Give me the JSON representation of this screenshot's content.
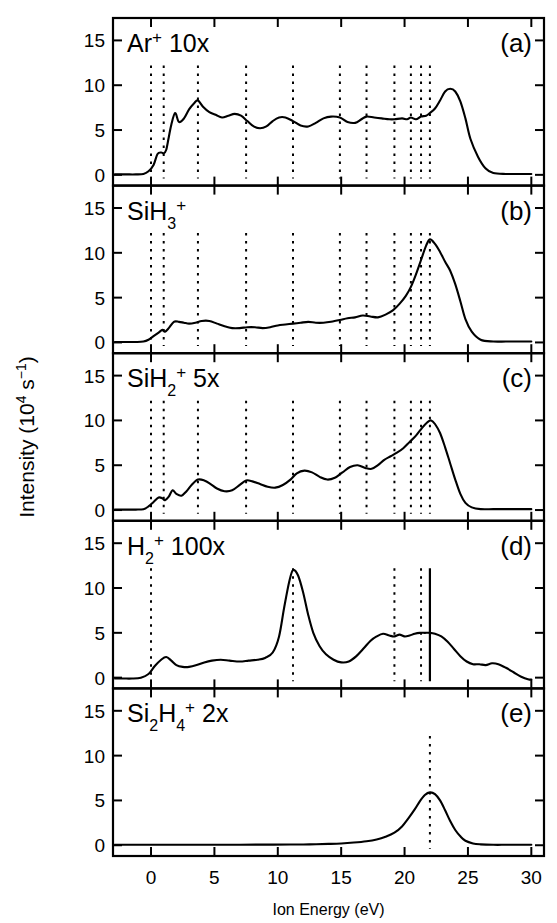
{
  "figure": {
    "xlabel": "Ion Energy (eV)",
    "ylabel_main": "Intensity (10",
    "ylabel_sup": "4",
    "ylabel_mid": " s",
    "ylabel_sup2": "-1",
    "ylabel_end": ")",
    "ylabel_full": "Intensity (10^4 s^-1)",
    "xticks": [
      0,
      5,
      10,
      15,
      20,
      25,
      30
    ],
    "yticks": [
      0,
      5,
      10,
      15
    ],
    "xlim": [
      -3,
      31
    ],
    "ylim": [
      -1.2,
      17.5
    ]
  },
  "chart_data": {
    "type": "line",
    "xlabel": "Ion Energy (eV)",
    "ylabel": "Intensity (10^4 s^-1)",
    "xlim": [
      -3,
      31
    ],
    "ylim": [
      -1.2,
      17.5
    ],
    "grid": false,
    "legend": "none",
    "panels": [
      {
        "id": "a",
        "panel_label": "(a)",
        "species": "Ar",
        "charge": "+",
        "sub": "",
        "multiplier": "10x",
        "label_text": "Ar+ 10x",
        "dotted_lines": [
          0.0,
          1.0,
          3.7,
          7.5,
          11.2,
          14.9,
          17.0,
          19.2,
          20.5,
          21.3,
          22.0
        ],
        "solid_lines": [],
        "x": [
          -3.0,
          -2.0,
          -1.2,
          -0.6,
          -0.2,
          0.2,
          0.5,
          0.8,
          1.0,
          1.2,
          1.4,
          1.6,
          1.9,
          2.2,
          2.6,
          3.0,
          3.4,
          3.7,
          4.1,
          4.6,
          5.1,
          5.6,
          6.1,
          6.6,
          7.1,
          7.6,
          8.1,
          8.6,
          9.1,
          9.6,
          10.1,
          10.6,
          11.2,
          11.8,
          12.4,
          13.0,
          13.6,
          14.2,
          14.9,
          15.5,
          16.1,
          16.6,
          17.0,
          17.6,
          18.2,
          18.8,
          19.2,
          19.8,
          20.2,
          20.5,
          20.9,
          21.3,
          21.7,
          22.0,
          22.4,
          22.8,
          23.2,
          23.6,
          24.0,
          24.4,
          24.8,
          25.2,
          25.8,
          26.4,
          27.0,
          28.0,
          29.0,
          30.0
        ],
        "y": [
          0.05,
          0.05,
          0.05,
          0.1,
          0.4,
          1.1,
          2.3,
          2.5,
          2.4,
          2.8,
          4.2,
          5.6,
          6.9,
          5.9,
          6.3,
          7.3,
          8.0,
          8.3,
          7.6,
          7.0,
          6.7,
          6.4,
          6.6,
          6.8,
          6.6,
          6.0,
          5.4,
          5.2,
          5.4,
          6.0,
          6.4,
          6.4,
          6.0,
          5.5,
          5.4,
          5.8,
          6.3,
          6.5,
          6.4,
          5.9,
          5.8,
          6.2,
          6.5,
          6.4,
          6.3,
          6.2,
          6.2,
          6.3,
          6.2,
          6.4,
          6.2,
          6.5,
          6.6,
          6.9,
          7.4,
          8.3,
          9.3,
          9.6,
          9.3,
          8.2,
          6.3,
          4.0,
          2.0,
          0.7,
          0.2,
          0.1,
          0.1,
          0.1
        ]
      },
      {
        "id": "b",
        "panel_label": "(b)",
        "species": "SiH",
        "charge": "+",
        "sub": "3",
        "multiplier": "",
        "label_text": "SiH3+",
        "dotted_lines": [
          0.0,
          1.0,
          3.7,
          7.5,
          11.2,
          14.9,
          17.0,
          19.2,
          20.5,
          21.3,
          22.0
        ],
        "solid_lines": [],
        "x": [
          -3.0,
          -2.0,
          -1.2,
          -0.6,
          -0.2,
          0.2,
          0.6,
          0.9,
          1.1,
          1.4,
          1.8,
          2.2,
          2.6,
          3.0,
          3.5,
          4.0,
          4.6,
          5.2,
          5.8,
          6.4,
          7.0,
          7.6,
          8.2,
          8.8,
          9.4,
          10.0,
          10.6,
          11.2,
          11.8,
          12.4,
          13.0,
          13.6,
          14.2,
          14.9,
          15.5,
          16.1,
          16.7,
          17.3,
          17.9,
          18.5,
          19.1,
          19.6,
          20.1,
          20.5,
          20.9,
          21.3,
          21.7,
          22.0,
          22.4,
          22.8,
          23.2,
          23.6,
          24.0,
          24.4,
          24.8,
          25.3,
          26.0,
          27.0,
          28.0,
          29.0,
          30.0
        ],
        "y": [
          0.05,
          0.05,
          0.05,
          0.1,
          0.3,
          0.7,
          1.1,
          1.4,
          1.2,
          1.6,
          2.3,
          2.3,
          2.2,
          2.1,
          2.2,
          2.4,
          2.4,
          2.1,
          1.8,
          1.6,
          1.6,
          1.7,
          1.7,
          1.6,
          1.7,
          1.9,
          2.0,
          2.1,
          2.2,
          2.3,
          2.2,
          2.2,
          2.3,
          2.5,
          2.7,
          2.8,
          3.0,
          2.9,
          2.8,
          3.1,
          3.6,
          4.3,
          5.2,
          6.2,
          7.6,
          9.2,
          10.8,
          11.5,
          11.0,
          10.1,
          9.0,
          8.0,
          6.5,
          4.6,
          2.6,
          1.2,
          0.3,
          0.1,
          0.1,
          0.1,
          0.1
        ]
      },
      {
        "id": "c",
        "panel_label": "(c)",
        "species": "SiH",
        "charge": "+",
        "sub": "2",
        "multiplier": "5x",
        "label_text": "SiH2+ 5x",
        "dotted_lines": [
          0.0,
          1.0,
          3.7,
          7.5,
          11.2,
          14.9,
          17.0,
          19.2,
          20.5,
          21.3,
          22.0
        ],
        "solid_lines": [],
        "x": [
          -3.0,
          -2.0,
          -1.2,
          -0.6,
          -0.2,
          0.2,
          0.6,
          0.9,
          1.1,
          1.4,
          1.7,
          2.0,
          2.4,
          2.8,
          3.2,
          3.7,
          4.2,
          4.7,
          5.2,
          5.8,
          6.4,
          7.0,
          7.5,
          8.0,
          8.6,
          9.2,
          9.8,
          10.4,
          11.0,
          11.5,
          12.1,
          12.7,
          13.3,
          13.9,
          14.5,
          15.1,
          15.7,
          16.3,
          16.9,
          17.4,
          17.9,
          18.4,
          18.9,
          19.4,
          19.9,
          20.4,
          20.9,
          21.4,
          21.8,
          22.1,
          22.4,
          22.8,
          23.2,
          23.6,
          24.0,
          24.4,
          24.8,
          25.3,
          26.0,
          27.0,
          28.0,
          29.0,
          30.0
        ],
        "y": [
          0.05,
          0.05,
          0.05,
          0.1,
          0.4,
          0.9,
          1.4,
          1.3,
          1.1,
          1.5,
          2.2,
          1.8,
          1.6,
          2.1,
          2.8,
          3.4,
          3.3,
          2.9,
          2.4,
          2.1,
          2.2,
          2.8,
          3.3,
          3.2,
          2.9,
          2.6,
          2.5,
          2.8,
          3.4,
          4.1,
          4.4,
          4.2,
          3.7,
          3.4,
          3.6,
          4.2,
          4.8,
          5.0,
          4.7,
          4.6,
          5.0,
          5.6,
          6.0,
          6.4,
          6.9,
          7.6,
          8.3,
          9.2,
          9.8,
          10.0,
          9.6,
          8.6,
          7.0,
          5.2,
          3.4,
          1.8,
          0.8,
          0.3,
          0.1,
          0.1,
          0.1,
          0.1,
          0.1
        ]
      },
      {
        "id": "d",
        "panel_label": "(d)",
        "species": "H",
        "charge": "+",
        "sub": "2",
        "multiplier": "100x",
        "label_text": "H2+ 100x",
        "dotted_lines": [
          0.0,
          11.2,
          19.2,
          21.3
        ],
        "solid_lines": [
          22.0
        ],
        "x": [
          -3.0,
          -2.2,
          -1.5,
          -0.8,
          -0.2,
          0.3,
          0.8,
          1.2,
          1.6,
          2.0,
          2.5,
          3.0,
          3.6,
          4.2,
          4.8,
          5.5,
          6.2,
          7.0,
          7.7,
          8.4,
          9.0,
          9.6,
          10.1,
          10.5,
          10.9,
          11.2,
          11.6,
          12.0,
          12.4,
          12.8,
          13.3,
          13.8,
          14.4,
          15.0,
          15.6,
          16.2,
          16.8,
          17.3,
          17.8,
          18.3,
          18.8,
          19.2,
          19.6,
          20.0,
          20.4,
          20.8,
          21.2,
          21.6,
          22.0,
          22.4,
          22.9,
          23.4,
          23.9,
          24.4,
          24.9,
          25.4,
          25.9,
          26.4,
          26.9,
          27.4,
          28.0,
          28.6,
          29.2,
          29.8,
          30.0
        ],
        "y": [
          -0.1,
          -0.1,
          -0.1,
          0.0,
          0.4,
          1.3,
          2.0,
          2.3,
          1.9,
          1.4,
          1.2,
          1.2,
          1.4,
          1.7,
          1.9,
          2.0,
          1.9,
          1.8,
          1.9,
          2.0,
          2.2,
          2.8,
          4.6,
          7.8,
          10.7,
          12.0,
          11.4,
          9.5,
          7.0,
          5.0,
          3.5,
          2.6,
          2.0,
          1.7,
          1.8,
          2.4,
          3.3,
          4.1,
          4.6,
          4.9,
          4.7,
          4.6,
          4.8,
          4.6,
          4.7,
          4.9,
          5.0,
          5.0,
          5.0,
          4.9,
          4.6,
          4.0,
          3.2,
          2.4,
          1.8,
          1.5,
          1.5,
          1.4,
          1.6,
          1.5,
          1.1,
          0.6,
          0.1,
          -0.2,
          -0.2
        ]
      },
      {
        "id": "e",
        "panel_label": "(e)",
        "species": "Si",
        "charge": "+",
        "sub": "2",
        "sub2": "4",
        "species2": "H",
        "multiplier": "2x",
        "label_text": "Si2H4+ 2x",
        "dotted_lines": [
          22.0
        ],
        "solid_lines": [],
        "x": [
          -3.0,
          -1.0,
          1.0,
          3.0,
          5.0,
          7.0,
          9.0,
          11.0,
          12.5,
          14.0,
          15.0,
          16.0,
          17.0,
          17.8,
          18.5,
          19.2,
          19.8,
          20.3,
          20.8,
          21.2,
          21.6,
          22.0,
          22.4,
          22.8,
          23.2,
          23.6,
          24.0,
          24.4,
          24.8,
          25.4,
          26.0,
          27.0,
          28.0,
          29.0,
          30.0
        ],
        "y": [
          0.05,
          0.05,
          0.05,
          0.05,
          0.05,
          0.06,
          0.07,
          0.08,
          0.1,
          0.15,
          0.2,
          0.3,
          0.45,
          0.65,
          0.95,
          1.4,
          2.1,
          3.0,
          4.0,
          4.9,
          5.6,
          5.9,
          5.7,
          5.0,
          3.9,
          2.7,
          1.7,
          1.0,
          0.5,
          0.2,
          0.1,
          0.05,
          0.05,
          0.05,
          0.05
        ]
      }
    ]
  }
}
